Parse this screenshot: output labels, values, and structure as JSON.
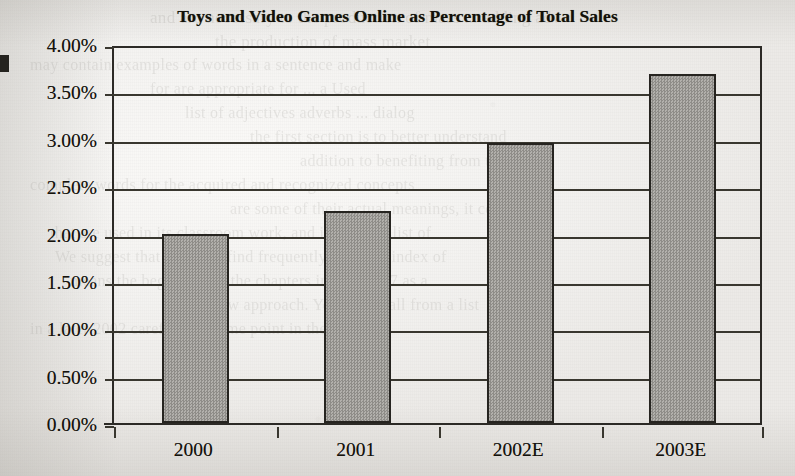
{
  "chart_data": {
    "type": "bar",
    "title": "Toys and Video Games Online as Percentage of Total Sales",
    "xlabel": "",
    "ylabel": "",
    "categories": [
      "2000",
      "2001",
      "2002E",
      "2003E"
    ],
    "values": [
      2.0,
      2.24,
      2.96,
      3.68
    ],
    "value_labels": [
      "2.00%",
      "2.24%",
      "2.96%",
      "3.68%"
    ],
    "ylim": [
      0.0,
      4.0
    ],
    "ytick_values": [
      0.0,
      0.5,
      1.0,
      1.5,
      2.0,
      2.5,
      3.0,
      3.5,
      4.0
    ],
    "ytick_labels": [
      "0.00%",
      "0.50%",
      "1.00%",
      "1.50%",
      "2.00%",
      "2.50%",
      "3.00%",
      "3.50%",
      "4.00%"
    ],
    "grid": "horizontal",
    "legend": "none",
    "bar_fill_color": "#9c9a96",
    "bar_border_color": "#262420",
    "axis_color": "#2c2a26",
    "text_color": "#14120c",
    "background_color": "#f2f1ef"
  },
  "page": {
    "media": "scanned-book-page",
    "ghost_text": [
      {
        "text": "and arc necessary to the production of mass ... adding adv",
        "x": 150,
        "y": 8,
        "size": 17,
        "opacity": 0.13
      },
      {
        "text": "the production of mass market",
        "x": 215,
        "y": 32,
        "size": 17,
        "opacity": 0.12
      },
      {
        "text": "may contain examples of words in a sentence and make",
        "x": 30,
        "y": 56,
        "size": 16,
        "opacity": 0.13
      },
      {
        "text": "for are appropriate for ... a Used",
        "x": 150,
        "y": 80,
        "size": 16,
        "opacity": 0.12
      },
      {
        "text": "list of adjectives adverbs ... dialog",
        "x": 185,
        "y": 104,
        "size": 16,
        "opacity": 0.13
      },
      {
        "text": "the first section is to better understand",
        "x": 250,
        "y": 128,
        "size": 16,
        "opacity": 0.12
      },
      {
        "text": "addition to benefiting from the",
        "x": 300,
        "y": 152,
        "size": 16,
        "opacity": 0.12
      },
      {
        "text": "complete words for the acquired and recognized concepts",
        "x": 30,
        "y": 176,
        "size": 16,
        "opacity": 0.12
      },
      {
        "text": "are some of their actual meanings, it could",
        "x": 230,
        "y": 200,
        "size": 16,
        "opacity": 0.12
      },
      {
        "text": "that are used in its classroom work, and interpret a list of",
        "x": 50,
        "y": 224,
        "size": 16,
        "opacity": 0.12
      },
      {
        "text": "We suggest that you may find frequently using an index of",
        "x": 55,
        "y": 248,
        "size": 16,
        "opacity": 0.12
      },
      {
        "text": "means the beginning of the chapters in Chapter 7 as a",
        "x": 70,
        "y": 272,
        "size": 16,
        "opacity": 0.12
      },
      {
        "text": "a new approach. You will shall from a list",
        "x": 200,
        "y": 296,
        "size": 16,
        "opacity": 0.12
      },
      {
        "text": "in a later 2002 carefully at some point in their careers",
        "x": 30,
        "y": 320,
        "size": 16,
        "opacity": 0.12
      }
    ]
  }
}
